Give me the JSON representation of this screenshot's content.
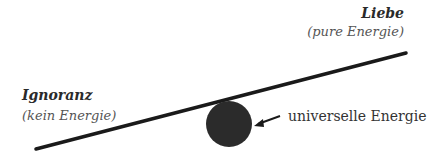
{
  "diagram": {
    "right_label": {
      "title": "Liebe",
      "subtitle": "(pure Energie)"
    },
    "left_label": {
      "title": "Ignoranz",
      "subtitle": "(kein Energie)"
    },
    "circle_label": "universelle Energie",
    "colors": {
      "line": "#1a1a1a",
      "circle": "#2b2b2b",
      "text": "#333333"
    }
  }
}
